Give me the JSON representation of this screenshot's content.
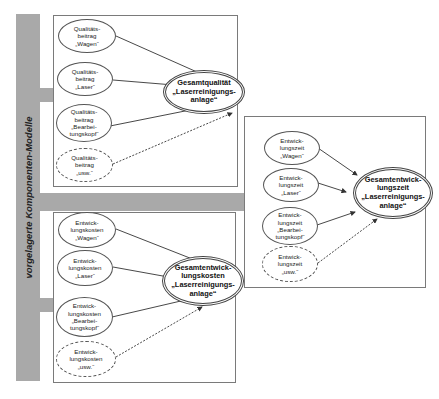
{
  "side_bar": {
    "label": "vorgelagerte Komponenten-Modelle",
    "color": "#a9a9a9"
  },
  "colors": {
    "bar": "#a9a9a9",
    "box_border": "#7a7a7a",
    "node_border": "#555555",
    "text": "#222222"
  },
  "groups": [
    {
      "id": "quality",
      "sources": [
        {
          "label": "Qualitäts-\nbeitrag\n„Wagen“",
          "style": "solid"
        },
        {
          "label": "Qualitäts-\nbeitrag\n„Laser“",
          "style": "solid"
        },
        {
          "label": "Qualitäts-\nbeitrag\n„Bearbei-\ntungskopf“",
          "style": "solid"
        },
        {
          "label": "Qualitäts-\nbeitrag\n„usw.“",
          "style": "dashed"
        }
      ],
      "target": {
        "label": "Gesamtqualität\n„Laserreinigungs-\nanlage“"
      }
    },
    {
      "id": "dev_time",
      "sources": [
        {
          "label": "Entwick-\nlungszeit\n„Wagen“",
          "style": "solid"
        },
        {
          "label": "Entwick-\nlungszeit\n„Laser“",
          "style": "solid"
        },
        {
          "label": "Entwick-\nlungszeit\n„Bearbei-\ntungskopf“",
          "style": "solid"
        },
        {
          "label": "Entwick-\nlungszeit\n„usw.“",
          "style": "dashed"
        }
      ],
      "target": {
        "label": "Gesamtentwick-\nlungszeit\n„Laserreinigungs-\nanlage“"
      }
    },
    {
      "id": "dev_cost",
      "sources": [
        {
          "label": "Entwick-\nlungskosten\n„Wagen“",
          "style": "solid"
        },
        {
          "label": "Entwick-\nlungskosten\n„Laser“",
          "style": "solid"
        },
        {
          "label": "Entwick-\nlungskosten\n„Bearbei-\ntungskopf“",
          "style": "solid"
        },
        {
          "label": "Entwick-\nlungskosten\n„usw.“",
          "style": "dashed"
        }
      ],
      "target": {
        "label": "Gesamtentwick-\nlungskosten\n„Laserreinigungs-\nanlage“"
      }
    }
  ]
}
